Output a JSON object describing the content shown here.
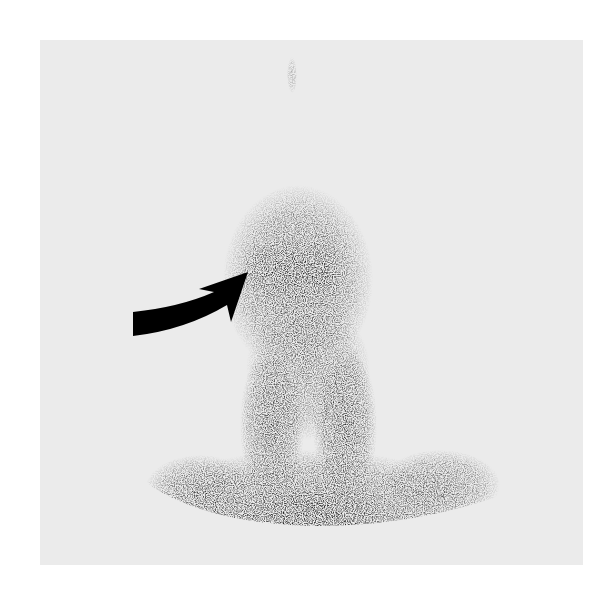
{
  "image": {
    "type": "nuclear medicine scintigraphy (grayscale)",
    "background_color": "#ebebeb",
    "uptake_color": "#1a1a1a",
    "description": "Anterior planar scan of head/neck region with focal uptake marked by a curved black arrow"
  },
  "annotations": [
    {
      "kind": "curved-arrow",
      "color": "#000000",
      "points_to": "upper-left focus of uptake",
      "label": ""
    }
  ]
}
